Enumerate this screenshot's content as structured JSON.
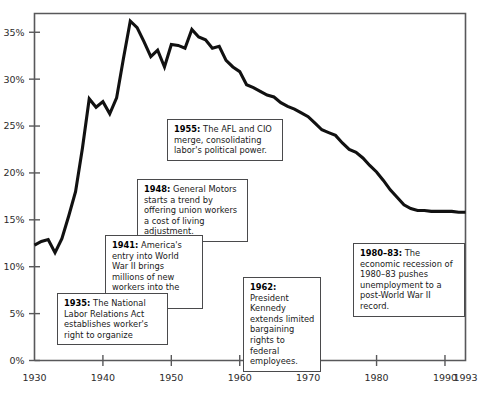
{
  "chart_data": {
    "type": "line",
    "title": "",
    "subtitle": "",
    "xlabel": "",
    "ylabel": "",
    "xlim": [
      1930,
      1993
    ],
    "ylim": [
      0,
      37
    ],
    "grid": false,
    "legend": "none",
    "y_tick_labels": [
      "0%",
      "5%",
      "10%",
      "15%",
      "20%",
      "25%",
      "30%",
      "35%"
    ],
    "y_ticks": [
      0,
      5,
      10,
      15,
      20,
      25,
      30,
      35
    ],
    "x_tick_labels": [
      "1930",
      "1940",
      "1950",
      "1960",
      "1970",
      "1980",
      "1990",
      "1993"
    ],
    "x_ticks": [
      1930,
      1940,
      1950,
      1960,
      1970,
      1980,
      1990,
      1993
    ],
    "series": [
      {
        "name": "Union membership as share of labor force",
        "x": [
          1930,
          1931,
          1932,
          1933,
          1934,
          1935,
          1936,
          1937,
          1938,
          1939,
          1940,
          1941,
          1942,
          1943,
          1944,
          1945,
          1946,
          1947,
          1948,
          1949,
          1950,
          1951,
          1952,
          1953,
          1954,
          1955,
          1956,
          1957,
          1958,
          1959,
          1960,
          1961,
          1962,
          1963,
          1964,
          1965,
          1966,
          1967,
          1968,
          1969,
          1970,
          1971,
          1972,
          1973,
          1974,
          1975,
          1976,
          1977,
          1978,
          1979,
          1980,
          1981,
          1982,
          1983,
          1984,
          1985,
          1986,
          1987,
          1988,
          1989,
          1990,
          1991,
          1992,
          1993
        ],
        "values": [
          12.3,
          12.7,
          12.9,
          11.5,
          13.0,
          15.4,
          18.0,
          22.6,
          27.9,
          27.0,
          27.6,
          26.3,
          28.0,
          32.2,
          36.2,
          35.5,
          34.0,
          32.4,
          33.1,
          31.3,
          33.7,
          33.6,
          33.3,
          35.3,
          34.5,
          34.2,
          33.3,
          33.5,
          32.0,
          31.3,
          30.8,
          29.4,
          29.1,
          28.7,
          28.3,
          28.1,
          27.5,
          27.1,
          26.8,
          26.4,
          26.0,
          25.3,
          24.6,
          24.3,
          24.0,
          23.2,
          22.5,
          22.2,
          21.6,
          20.8,
          20.1,
          19.2,
          18.2,
          17.4,
          16.6,
          16.2,
          16.0,
          16.0,
          15.9,
          15.9,
          15.9,
          15.9,
          15.8,
          15.8
        ]
      }
    ],
    "annotations": [
      {
        "id": "1955",
        "year": "1955:",
        "text": " The AFL and CIO merge, consolidating labor's political power."
      },
      {
        "id": "1948",
        "year": "1948:",
        "text": " General Motors starts a trend by offering union workers a cost of living adjustment."
      },
      {
        "id": "1941",
        "year": "1941:",
        "text": " America's entry into World War II brings millions of new workers into the labor force."
      },
      {
        "id": "1935",
        "year": "1935:",
        "text": " The National Labor Relations Act establishes worker's right to organize"
      },
      {
        "id": "1962",
        "year": "1962:",
        "text": " President Kennedy extends limited bargaining rights to federal employees."
      },
      {
        "id": "1980",
        "year": "1980–83:",
        "text": " The economic recession of 1980–83 pushes unemployment to a post-World War II record."
      }
    ],
    "colors": {
      "line": "#111111",
      "axis": "#58585a",
      "box_border": "#4a4a4c",
      "background": "#ffffff"
    }
  }
}
